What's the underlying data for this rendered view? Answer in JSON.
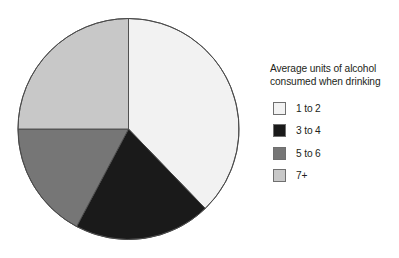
{
  "chart_data": {
    "type": "pie",
    "title": "",
    "legend_title": "Average units of alcohol\nconsumed when drinking",
    "legend_position": "right",
    "grid": false,
    "units": "percent",
    "start_angle_deg": 0,
    "direction": "clockwise",
    "categories": [
      "1 to 2",
      "3 to 4",
      "5 to 6",
      "7+"
    ],
    "values": [
      37.8,
      20.0,
      17.2,
      25.0
    ],
    "angles_deg": [
      136,
      72,
      62,
      90
    ],
    "colors": [
      "#f2f2f2",
      "#1a1a1a",
      "#767676",
      "#c8c8c8"
    ],
    "slices": [
      {
        "label": "1 to 2",
        "value": 37.8,
        "angle_deg": 136,
        "color": "#f2f2f2"
      },
      {
        "label": "3 to 4",
        "value": 20.0,
        "angle_deg": 72,
        "color": "#1a1a1a"
      },
      {
        "label": "5 to 6",
        "value": 17.2,
        "angle_deg": 62,
        "color": "#767676"
      },
      {
        "label": "7+",
        "value": 25.0,
        "angle_deg": 90,
        "color": "#c8c8c8"
      }
    ],
    "xlabel": "",
    "ylabel": ""
  },
  "legend": {
    "title": "Average units of alcohol\nconsumed when drinking",
    "items": [
      {
        "label": "1 to 2",
        "color": "#f2f2f2"
      },
      {
        "label": "3 to 4",
        "color": "#1a1a1a"
      },
      {
        "label": "5 to 6",
        "color": "#767676"
      },
      {
        "label": "7+",
        "color": "#c8c8c8"
      }
    ]
  },
  "pie": {
    "center_x": 128.5,
    "center_y": 129,
    "radius": 110.5,
    "outline_color": "#4a4a4a"
  }
}
